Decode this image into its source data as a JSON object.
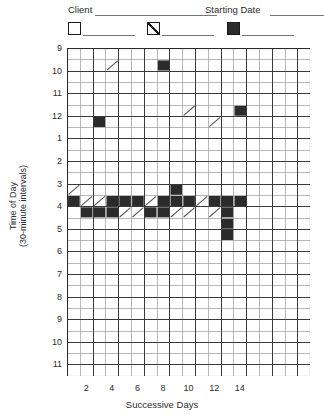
{
  "legend": {
    "client_label": "Client",
    "client_rule_width": 122,
    "starting_date_label": "Starting Date",
    "date_rule_width": 74,
    "keys": [
      {
        "name": "open-square-key",
        "style": "open",
        "rule_width": 52
      },
      {
        "name": "hatched-square-key",
        "style": "hatch",
        "rule_width": 52
      },
      {
        "name": "filled-square-key",
        "style": "full",
        "rule_width": 52
      }
    ]
  },
  "axes": {
    "y_title": "Time of Day\n(30-minute intervals)",
    "x_title": "Successive Days",
    "y_labels": [
      "9",
      "10",
      "11",
      "12",
      "1",
      "2",
      "3",
      "4",
      "5",
      "6",
      "7",
      "8",
      "9",
      "10",
      "11"
    ],
    "x_labels": [
      "2",
      "4",
      "6",
      "8",
      "10",
      "12",
      "14"
    ]
  },
  "chart_data": {
    "type": "heatmap",
    "title": "",
    "xlabel": "Successive Days",
    "ylabel": "Time of Day (30-minute intervals)",
    "grid": true,
    "legend_position": "top",
    "x_labels": [
      "2",
      "4",
      "6",
      "8",
      "10",
      "12",
      "14"
    ],
    "y_labels": [
      "9",
      "10",
      "11",
      "12",
      "1",
      "2",
      "3",
      "4",
      "5",
      "6",
      "7",
      "8",
      "9",
      "10",
      "11"
    ],
    "columns": 19,
    "rows": 29,
    "cell_px": {
      "w": 12.8,
      "h": 11.3
    },
    "origin_px": {
      "x": 67,
      "y": 48
    },
    "x_tick_cols": [
      1,
      3,
      5,
      7,
      9,
      11,
      13
    ],
    "colors": {
      "full": "#2b2b2b",
      "hatch": "#555555",
      "grid_minor": "#9a9a9a",
      "grid_major": "#3a3a3a",
      "frame": "#2b2b2b"
    },
    "categories_note": "col index 0-based from left; row index 0-based from top, 2 rows per hour starting at 9",
    "cells": [
      {
        "col": 3,
        "row": 1,
        "fill": "hatch"
      },
      {
        "col": 7,
        "row": 1,
        "fill": "full"
      },
      {
        "col": 2,
        "row": 6,
        "fill": "full"
      },
      {
        "col": 9,
        "row": 5,
        "fill": "hatch"
      },
      {
        "col": 11,
        "row": 6,
        "fill": "hatch"
      },
      {
        "col": 13,
        "row": 5,
        "fill": "full"
      },
      {
        "col": 0,
        "row": 12,
        "fill": "hatch"
      },
      {
        "col": 0,
        "row": 13,
        "fill": "full"
      },
      {
        "col": 1,
        "row": 13,
        "fill": "hatch"
      },
      {
        "col": 1,
        "row": 14,
        "fill": "full"
      },
      {
        "col": 2,
        "row": 13,
        "fill": "hatch"
      },
      {
        "col": 2,
        "row": 14,
        "fill": "full"
      },
      {
        "col": 3,
        "row": 13,
        "fill": "full"
      },
      {
        "col": 3,
        "row": 14,
        "fill": "full"
      },
      {
        "col": 4,
        "row": 13,
        "fill": "full"
      },
      {
        "col": 4,
        "row": 14,
        "fill": "hatch"
      },
      {
        "col": 5,
        "row": 13,
        "fill": "full"
      },
      {
        "col": 5,
        "row": 14,
        "fill": "hatch"
      },
      {
        "col": 6,
        "row": 13,
        "fill": "hatch"
      },
      {
        "col": 6,
        "row": 14,
        "fill": "full"
      },
      {
        "col": 7,
        "row": 13,
        "fill": "full"
      },
      {
        "col": 7,
        "row": 14,
        "fill": "full"
      },
      {
        "col": 8,
        "row": 12,
        "fill": "full"
      },
      {
        "col": 8,
        "row": 13,
        "fill": "full"
      },
      {
        "col": 8,
        "row": 14,
        "fill": "hatch"
      },
      {
        "col": 9,
        "row": 13,
        "fill": "full"
      },
      {
        "col": 9,
        "row": 14,
        "fill": "hatch"
      },
      {
        "col": 10,
        "row": 13,
        "fill": "hatch"
      },
      {
        "col": 11,
        "row": 13,
        "fill": "full"
      },
      {
        "col": 11,
        "row": 14,
        "fill": "hatch"
      },
      {
        "col": 12,
        "row": 13,
        "fill": "full"
      },
      {
        "col": 12,
        "row": 14,
        "fill": "full"
      },
      {
        "col": 12,
        "row": 15,
        "fill": "full"
      },
      {
        "col": 12,
        "row": 16,
        "fill": "full"
      },
      {
        "col": 13,
        "row": 13,
        "fill": "full"
      }
    ]
  }
}
